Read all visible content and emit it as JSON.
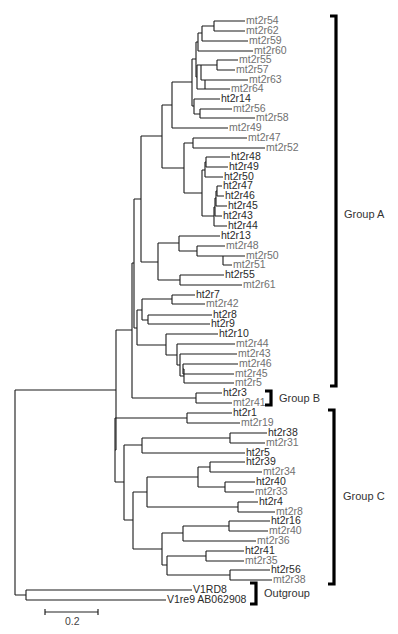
{
  "figure": {
    "type": "phylogenetic-tree",
    "leaf_colors": {
      "ht": "#2a2a2a",
      "mt": "#707070",
      "outgroup": "#2a2a2a"
    }
  },
  "leaves": [
    {
      "id": "mt2r54",
      "label": "mt2r54",
      "kind": "mt",
      "x": 245,
      "y": 21
    },
    {
      "id": "mt2r62",
      "label": "mt2r62",
      "kind": "mt",
      "x": 245,
      "y": 31
    },
    {
      "id": "mt2r59",
      "label": "mt2r59",
      "kind": "mt",
      "x": 248,
      "y": 41
    },
    {
      "id": "mt2r60",
      "label": "mt2r60",
      "kind": "mt",
      "x": 253,
      "y": 51
    },
    {
      "id": "mt2r55",
      "label": "mt2r55",
      "kind": "mt",
      "x": 238,
      "y": 60
    },
    {
      "id": "mt2r57",
      "label": "mt2r57",
      "kind": "mt",
      "x": 235,
      "y": 70
    },
    {
      "id": "mt2r63",
      "label": "mt2r63",
      "kind": "mt",
      "x": 248,
      "y": 80
    },
    {
      "id": "mt2r64",
      "label": "mt2r64",
      "kind": "mt",
      "x": 230,
      "y": 89
    },
    {
      "id": "ht2r14",
      "label": "ht2r14",
      "kind": "ht",
      "x": 220,
      "y": 99
    },
    {
      "id": "mt2r56",
      "label": "mt2r56",
      "kind": "mt",
      "x": 232,
      "y": 109
    },
    {
      "id": "mt2r58",
      "label": "mt2r58",
      "kind": "mt",
      "x": 255,
      "y": 118
    },
    {
      "id": "mt2r49",
      "label": "mt2r49",
      "kind": "mt",
      "x": 228,
      "y": 128
    },
    {
      "id": "mt2r47",
      "label": "mt2r47",
      "kind": "mt",
      "x": 247,
      "y": 138
    },
    {
      "id": "mt2r52",
      "label": "mt2r52",
      "kind": "mt",
      "x": 265,
      "y": 148
    },
    {
      "id": "ht2r48",
      "label": "ht2r48",
      "kind": "ht",
      "x": 230,
      "y": 157
    },
    {
      "id": "ht2r49",
      "label": "ht2r49",
      "kind": "ht",
      "x": 228,
      "y": 167
    },
    {
      "id": "ht2r50",
      "label": "ht2r50",
      "kind": "ht",
      "x": 223,
      "y": 177
    },
    {
      "id": "ht2r47",
      "label": "ht2r47",
      "kind": "ht",
      "x": 222,
      "y": 186
    },
    {
      "id": "ht2r46",
      "label": "ht2r46",
      "kind": "ht",
      "x": 224,
      "y": 196
    },
    {
      "id": "ht2r45",
      "label": "ht2r45",
      "kind": "ht",
      "x": 227,
      "y": 206
    },
    {
      "id": "ht2r43",
      "label": "ht2r43",
      "kind": "ht",
      "x": 222,
      "y": 216
    },
    {
      "id": "ht2r44",
      "label": "ht2r44",
      "kind": "ht",
      "x": 227,
      "y": 226
    },
    {
      "id": "ht2r13",
      "label": "ht2r13",
      "kind": "ht",
      "x": 220,
      "y": 236
    },
    {
      "id": "mt2r48",
      "label": "mt2r48",
      "kind": "mt",
      "x": 225,
      "y": 246
    },
    {
      "id": "mt2r50",
      "label": "mt2r50",
      "kind": "mt",
      "x": 245,
      "y": 256
    },
    {
      "id": "mt2r51",
      "label": "mt2r51",
      "kind": "mt",
      "x": 232,
      "y": 265
    },
    {
      "id": "ht2r55",
      "label": "ht2r55",
      "kind": "ht",
      "x": 224,
      "y": 275
    },
    {
      "id": "mt2r61",
      "label": "mt2r61",
      "kind": "mt",
      "x": 242,
      "y": 285
    },
    {
      "id": "ht2r7",
      "label": "ht2r7",
      "kind": "ht",
      "x": 195,
      "y": 295
    },
    {
      "id": "mt2r42",
      "label": "mt2r42",
      "kind": "mt",
      "x": 205,
      "y": 304
    },
    {
      "id": "ht2r8",
      "label": "ht2r8",
      "kind": "ht",
      "x": 212,
      "y": 315
    },
    {
      "id": "ht2r9",
      "label": "ht2r9",
      "kind": "ht",
      "x": 210,
      "y": 324
    },
    {
      "id": "ht2r10",
      "label": "ht2r10",
      "kind": "ht",
      "x": 218,
      "y": 334
    },
    {
      "id": "mt2r44",
      "label": "mt2r44",
      "kind": "mt",
      "x": 235,
      "y": 344
    },
    {
      "id": "mt2r43",
      "label": "mt2r43",
      "kind": "mt",
      "x": 237,
      "y": 354
    },
    {
      "id": "mt2r46",
      "label": "mt2r46",
      "kind": "mt",
      "x": 238,
      "y": 364
    },
    {
      "id": "mt2r45",
      "label": "mt2r45",
      "kind": "mt",
      "x": 234,
      "y": 374
    },
    {
      "id": "mt2r5",
      "label": "mt2r5",
      "kind": "mt",
      "x": 234,
      "y": 383
    },
    {
      "id": "ht2r3",
      "label": "ht2r3",
      "kind": "ht",
      "x": 222,
      "y": 393
    },
    {
      "id": "mt2r41",
      "label": "mt2r41",
      "kind": "mt",
      "x": 232,
      "y": 403
    },
    {
      "id": "ht2r1",
      "label": "ht2r1",
      "kind": "ht",
      "x": 232,
      "y": 413
    },
    {
      "id": "mt2r19",
      "label": "mt2r19",
      "kind": "mt",
      "x": 240,
      "y": 423
    },
    {
      "id": "ht2r38",
      "label": "ht2r38",
      "kind": "ht",
      "x": 267,
      "y": 433
    },
    {
      "id": "mt2r31",
      "label": "mt2r31",
      "kind": "mt",
      "x": 265,
      "y": 443
    },
    {
      "id": "ht2r5",
      "label": "ht2r5",
      "kind": "ht",
      "x": 245,
      "y": 453
    },
    {
      "id": "ht2r39",
      "label": "ht2r39",
      "kind": "ht",
      "x": 245,
      "y": 462
    },
    {
      "id": "mt2r34",
      "label": "mt2r34",
      "kind": "mt",
      "x": 262,
      "y": 472
    },
    {
      "id": "ht2r40",
      "label": "ht2r40",
      "kind": "ht",
      "x": 255,
      "y": 482
    },
    {
      "id": "mt2r33",
      "label": "mt2r33",
      "kind": "mt",
      "x": 254,
      "y": 492
    },
    {
      "id": "ht2r4",
      "label": "ht2r4",
      "kind": "ht",
      "x": 258,
      "y": 502
    },
    {
      "id": "mt2r8",
      "label": "mt2r8",
      "kind": "mt",
      "x": 275,
      "y": 512
    },
    {
      "id": "ht2r16",
      "label": "ht2r16",
      "kind": "ht",
      "x": 270,
      "y": 521
    },
    {
      "id": "mt2r40",
      "label": "mt2r40",
      "kind": "mt",
      "x": 268,
      "y": 531
    },
    {
      "id": "mt2r36",
      "label": "mt2r36",
      "kind": "mt",
      "x": 256,
      "y": 541
    },
    {
      "id": "ht2r41",
      "label": "ht2r41",
      "kind": "ht",
      "x": 244,
      "y": 551
    },
    {
      "id": "mt2r35",
      "label": "mt2r35",
      "kind": "mt",
      "x": 244,
      "y": 561
    },
    {
      "id": "ht2r56",
      "label": "ht2r56",
      "kind": "ht",
      "x": 270,
      "y": 570
    },
    {
      "id": "mt2r38",
      "label": "mt2r38",
      "kind": "mt",
      "x": 272,
      "y": 580
    },
    {
      "id": "V1RD8",
      "label": "V1RD8",
      "kind": "outgroup",
      "x": 192,
      "y": 590
    },
    {
      "id": "V1re9",
      "label": "V1re9 AB062908",
      "kind": "outgroup",
      "x": 166,
      "y": 600
    }
  ],
  "branches": [
    "M214 21 H245 M214 31 H245 M214 21 V31",
    "M202 26 H214 M202 41 H248 M202 26 V41",
    "M198 33 H202 M198 51 H253 M198 33 V51",
    "M217 60 H238 M217 70 H235 M217 60 V70",
    "M201 65 H217 M201 80 H248 M201 65 V80",
    "M205 80 H205 M205 89 H230 M205 80 V89",
    "M197 65 H201 M197 89 H205 M197 65 V89",
    "M196 42 H198 M196 77 H197 M196 42 V77",
    "M200 109 H232 M200 118 H255 M200 109 V118",
    "M194 99 H220 M194 114 H200 M194 99 V114",
    "M192 59 H196 M192 106 H194 M192 59 V106",
    "M172 82 H192 M172 128 H228 M172 82 V128",
    "M193 138 H247 M193 148 H265 M193 138 V148",
    "M206 157 H230 M206 167 H228 M206 157 V167",
    "M205 162 H206 M205 177 H223 M205 162 V177",
    "M217 186 H222 M217 196 H224 M217 186 V196",
    "M216 191 H217 M216 206 H227 M216 191 V206",
    "M215 198 H216 M215 216 H222 M215 198 V216",
    "M214 207 H215 M214 226 H227 M214 207 V226",
    "M202 170 H205 M202 216 H214 M202 170 V216",
    "M184 143 H193 M184 193 H202 M184 143 V193",
    "M162 105 H172 M162 168 H184 M162 105 V168",
    "M197 246 H225 M197 256 H245 M197 246 V256",
    "M223 256 H223 M223 265 H232 M223 256 V265",
    "M179 236 H220 M179 251 H197 M179 236 V251",
    "M180 275 H224 M180 285 H242 M180 275 V285",
    "M158 243 H179 M158 280 H180 M158 243 V280",
    "M141 136 H162 M141 262 H158 M141 136 V262",
    "M172 295 H195 M172 304 H205 M172 295 V304",
    "M148 315 H212 M148 324 H210 M148 315 V324",
    "M142 299 H172 M142 320 H148 M142 299 V320",
    "M183 364 H238 M183 374 H234 M183 364 V374",
    "M184 369 H183 M184 383 H234 M184 369 V383",
    "M180 354 H237 M180 376 H184 M180 354 V376",
    "M177 344 H235 M177 365 H180 M177 344 V365",
    "M166 334 H218 M166 355 H177 M166 334 V355",
    "M137 310 H142 M137 345 H166 M137 310 V345",
    "M134 199 H141 M134 328 H137 M134 199 V328",
    "M196 393 H222 M196 403 H232 M196 393 V403",
    "M132 263 H134 M132 398 H196 M132 263 V398",
    "M187 413 H232 M187 423 H240 M187 413 V423",
    "M230 433 H267 M230 443 H265 M230 433 V443",
    "M142 438 H230 M142 453 H245 M142 438 V453",
    "M210 472 H262 M210 462 H245 M210 462 V472",
    "M225 482 H255 M225 492 H254 M225 482 V492",
    "M198 467 H210 M198 487 H225 M198 467 V487",
    "M238 502 H258 M238 512 H275 M238 502 V512",
    "M147 477 H198 M147 507 H238 M147 477 V507",
    "M229 521 H270 M229 531 H268 M229 521 V531",
    "M183 526 H229 M183 541 H256 M183 526 V541",
    "M206 551 H244 M206 561 H244 M206 551 V561",
    "M230 570 H270 M230 580 H272 M230 570 V580",
    "M167 556 H206 M167 575 H230 M167 556 V575",
    "M162 533 H183 M162 565 H167 M162 533 V565",
    "M133 492 H147 M133 549 H162 M133 492 V549",
    "M124 445 H142 M124 520 H133 M124 445 V520",
    "M115 418 H187 M115 482 H124 M115 418 V482",
    "M116 330 H132 M116 450 H115 M116 330 V450",
    "M26 590 H192 M26 600 H166 M26 590 V600",
    "M15 390 H116 M15 595 H26 M15 390 V595"
  ],
  "groups": [
    {
      "id": "group-a",
      "label": "Group A",
      "top": 16,
      "bottom": 386,
      "x": 336,
      "label_x": 344,
      "label_y": 215
    },
    {
      "id": "group-b",
      "label": "Group B",
      "top": 391,
      "bottom": 405,
      "x": 271,
      "label_x": 279,
      "label_y": 399
    },
    {
      "id": "group-c",
      "label": "Group C",
      "top": 410,
      "bottom": 584,
      "x": 334,
      "label_x": 343,
      "label_y": 497
    },
    {
      "id": "outgroup",
      "label": "Outgroup",
      "top": 583,
      "bottom": 604,
      "x": 256,
      "label_x": 264,
      "label_y": 594
    }
  ],
  "scale_bar": {
    "label": "0.2",
    "x1": 45,
    "x2": 98,
    "y": 612,
    "label_x": 65,
    "label_y": 625
  }
}
